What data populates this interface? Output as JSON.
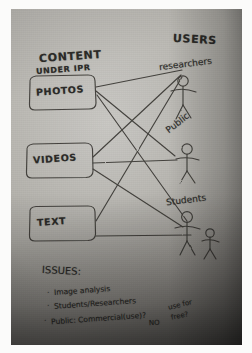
{
  "media": {
    "kind": "photograph-of-handdrawn-diagram",
    "surface": "paper",
    "ink_color": "#2b2a28",
    "paper_color": "#ada9a3",
    "frame_color": "#fbfbfa"
  },
  "diagram": {
    "left_heading": {
      "line1": "CONTENT",
      "line2": "UNDER IPR"
    },
    "right_heading": "USERS",
    "content_nodes": [
      {
        "label": "PHOTOS"
      },
      {
        "label": "VIDEOS"
      },
      {
        "label": "TEXT"
      }
    ],
    "user_nodes": [
      {
        "label": "researchers",
        "figures": 1
      },
      {
        "label": "Public",
        "figures": 1
      },
      {
        "label": "Students",
        "figures": 2
      }
    ],
    "edges": [
      {
        "from": "PHOTOS",
        "to": "researchers"
      },
      {
        "from": "PHOTOS",
        "to": "Public"
      },
      {
        "from": "PHOTOS",
        "to": "Students"
      },
      {
        "from": "VIDEOS",
        "to": "researchers"
      },
      {
        "from": "VIDEOS",
        "to": "Public"
      },
      {
        "from": "VIDEOS",
        "to": "Students"
      },
      {
        "from": "TEXT",
        "to": "researchers"
      },
      {
        "from": "TEXT",
        "to": "Students"
      }
    ]
  },
  "issues": {
    "heading": "ISSUES:",
    "items": [
      {
        "bullet": "·",
        "text": "Image analysis"
      },
      {
        "bullet": "·",
        "text": "Students/Researchers"
      },
      {
        "bullet": "·",
        "text": "Public: Commercial(use)?"
      }
    ],
    "annotations": [
      {
        "text": "NO"
      },
      {
        "text": "use for"
      },
      {
        "text": "free?"
      }
    ]
  }
}
